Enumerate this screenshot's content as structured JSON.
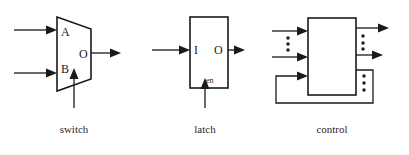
{
  "figure": {
    "background": "#ffffff",
    "ink": "#1a1a1a",
    "width": 409,
    "height": 155
  },
  "blocks": [
    {
      "id": "switch",
      "caption": "switch",
      "shape": "trapezoid-mux",
      "ports": [
        {
          "name": "A",
          "label": "A",
          "side": "left",
          "kind": "input"
        },
        {
          "name": "B",
          "label": "B",
          "side": "left",
          "kind": "input"
        },
        {
          "name": "O",
          "label": "O",
          "side": "right",
          "kind": "output"
        }
      ],
      "control_port": {
        "label": "",
        "side": "bottom",
        "kind": "control"
      },
      "input_count": 2,
      "output_count": 1
    },
    {
      "id": "latch",
      "caption": "latch",
      "shape": "rectangle",
      "ports": [
        {
          "name": "I",
          "label": "I",
          "side": "left",
          "kind": "input"
        },
        {
          "name": "O",
          "label": "O",
          "side": "right",
          "kind": "output"
        },
        {
          "name": "en",
          "label": "en",
          "side": "bottom",
          "kind": "enable"
        }
      ],
      "input_count": 1,
      "output_count": 1
    },
    {
      "id": "control",
      "caption": "control",
      "shape": "rectangle",
      "ports": [],
      "input_count": 2,
      "output_count": 2,
      "has_feedback_loop": true,
      "ellipsis_groups": [
        {
          "name": "input-ellipsis",
          "dots": 3,
          "side": "left"
        },
        {
          "name": "output-ellipsis",
          "dots": 3,
          "side": "right"
        },
        {
          "name": "feedback-ellipsis",
          "dots": 3,
          "side": "right-lower"
        }
      ]
    }
  ],
  "captions": {
    "switch": "switch",
    "latch": "latch",
    "control": "control"
  },
  "labels": {
    "switch_a": "A",
    "switch_b": "B",
    "switch_o": "O",
    "latch_i": "I",
    "latch_o": "O",
    "latch_en": "en"
  }
}
